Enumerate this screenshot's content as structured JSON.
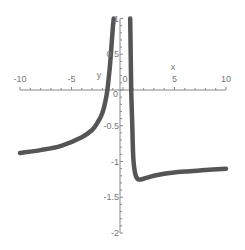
{
  "chart_data": {
    "type": "line",
    "title": "",
    "xlabel": "x",
    "ylabel": "y",
    "xlim": [
      -10,
      10
    ],
    "ylim": [
      -2,
      1
    ],
    "grid": false,
    "legend": null,
    "x_ticks": [
      -10,
      -5,
      0,
      5,
      10
    ],
    "x_tick_labels": [
      "-10",
      "-5",
      "0",
      "5",
      "10"
    ],
    "y_ticks": [
      -2,
      -1.5,
      -1,
      -0.5,
      0,
      0.5,
      1
    ],
    "y_tick_labels": [
      "-2",
      "-1.5",
      "-1",
      "-0.5",
      "0",
      "0.5",
      "1"
    ],
    "line_color": "#555555",
    "series": [
      {
        "name": "left-branch",
        "x": [
          -10,
          -8,
          -6,
          -4,
          -3,
          -2.5,
          -2,
          -1.6,
          -1.4,
          -1.2,
          -1.0,
          -0.9
        ],
        "y": [
          -0.88,
          -0.84,
          -0.78,
          -0.66,
          -0.56,
          -0.46,
          -0.32,
          -0.08,
          0.15,
          0.45,
          0.85,
          1.0
        ]
      },
      {
        "name": "right-branch",
        "x": [
          0.7,
          0.75,
          0.8,
          0.9,
          1.0,
          1.2,
          1.5,
          2,
          3,
          4,
          6,
          8,
          10
        ],
        "y": [
          1.0,
          0.5,
          0.0,
          -0.5,
          -0.95,
          -1.18,
          -1.25,
          -1.24,
          -1.2,
          -1.17,
          -1.14,
          -1.12,
          -1.1
        ]
      }
    ]
  }
}
